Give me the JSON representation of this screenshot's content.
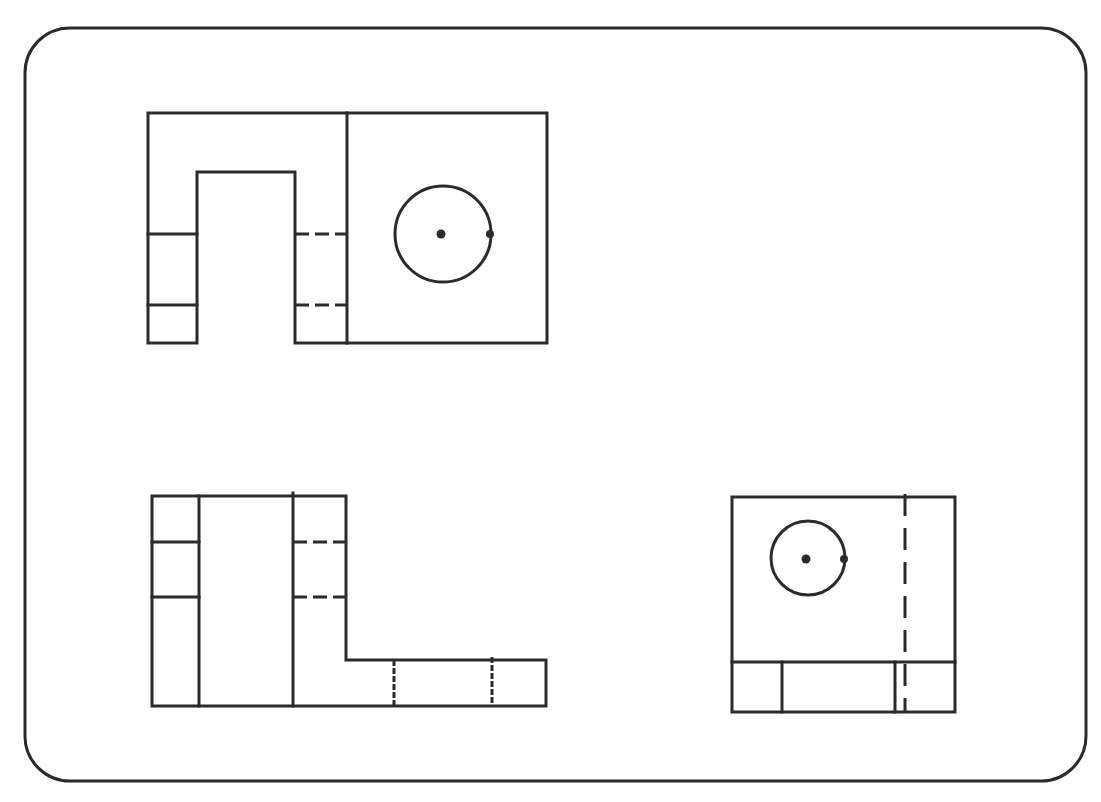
{
  "drawing": {
    "type": "orthographic-projection",
    "line_color": "#2b2b2b",
    "background": "#ffffff",
    "frame": {
      "x": 25,
      "y": 28,
      "width": 1061,
      "height": 753,
      "radius": 45
    },
    "views": [
      {
        "name": "top-view",
        "outline": {
          "x": 148,
          "y": 113,
          "width": 399,
          "height": 230
        },
        "divider_x": 347,
        "slot": {
          "x1": 197,
          "x2": 295,
          "top": 172
        },
        "hidden_lines_y": [
          234,
          305
        ],
        "hole": {
          "cx": 443,
          "cy": 234,
          "r": 48
        }
      },
      {
        "name": "front-view",
        "outline": {
          "x": 152,
          "y": 496,
          "right": 546,
          "bottom": 706,
          "step_x": 346,
          "step_y": 660
        },
        "verticals_x": [
          199,
          293
        ],
        "hidden_lines_y": [
          542,
          597
        ],
        "hidden_verticals_x": [
          394,
          492
        ]
      },
      {
        "name": "side-view",
        "outline": {
          "x": 732,
          "y": 497,
          "width": 223,
          "height": 215
        },
        "base_line_y": 662,
        "base_verticals_x": [
          782,
          895
        ],
        "hidden_vertical_x": 905,
        "hole": {
          "cx": 808,
          "cy": 558,
          "r": 37
        }
      }
    ]
  }
}
